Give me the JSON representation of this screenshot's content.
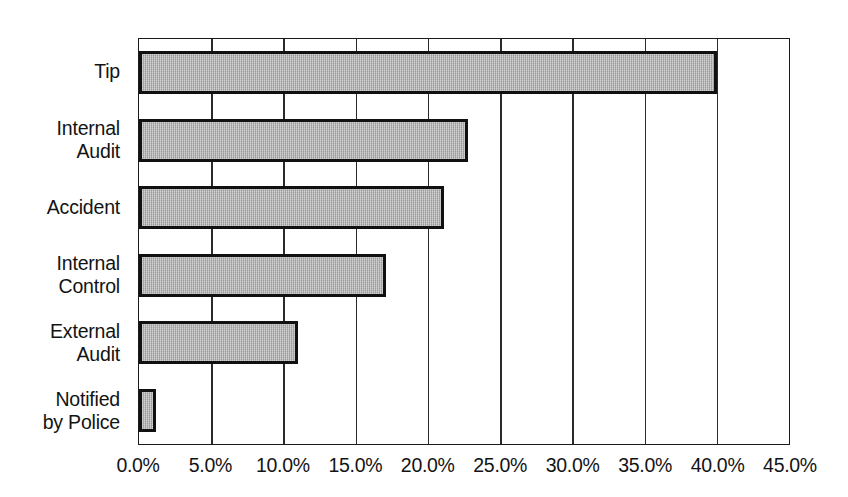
{
  "chart_data": {
    "type": "bar",
    "orientation": "horizontal",
    "title": "",
    "subtitle": "",
    "xlabel": "",
    "ylabel": "",
    "categories": [
      "Tip",
      "Internal Audit",
      "Accident",
      "Internal Control",
      "External Audit",
      "Notified by Police"
    ],
    "category_lines": [
      [
        "Tip"
      ],
      [
        "Internal",
        "Audit"
      ],
      [
        "Accident"
      ],
      [
        "Internal",
        "Control"
      ],
      [
        "External",
        "Audit"
      ],
      [
        "Notified",
        "by Police"
      ]
    ],
    "values": [
      40.0,
      22.8,
      21.1,
      17.1,
      11.0,
      1.2
    ],
    "value_format": "percent",
    "xlim": [
      0.0,
      45.0
    ],
    "xticks": [
      0.0,
      5.0,
      10.0,
      15.0,
      20.0,
      25.0,
      30.0,
      35.0,
      40.0,
      45.0
    ],
    "xtick_labels": [
      "0.0%",
      "5.0%",
      "10.0%",
      "15.0%",
      "20.0%",
      "25.0%",
      "30.0%",
      "35.0%",
      "40.0%",
      "45.0%"
    ],
    "grid": "vertical",
    "legend": "none",
    "series": [
      {
        "name": "Initial Detection of Occupational Fraud",
        "values": [
          40.0,
          22.8,
          21.1,
          17.1,
          11.0,
          1.2
        ]
      }
    ],
    "colors": {
      "bar_fill": "#aaaaaa",
      "bar_border": "#111111",
      "axis": "#1a1a1a",
      "gridline": "#2a2a2a",
      "text": "#131313",
      "background": "#ffffff"
    }
  }
}
